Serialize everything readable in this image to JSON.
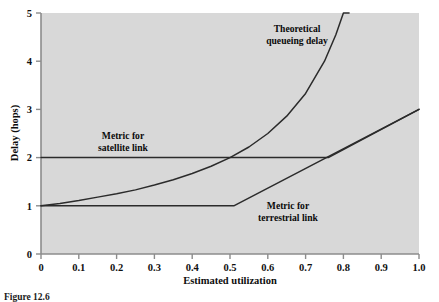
{
  "chart_data": {
    "type": "line",
    "title": "",
    "xlabel": "Estimated utilization",
    "ylabel": "Delay (hops)",
    "xlim": [
      0,
      1.0
    ],
    "ylim": [
      0,
      5
    ],
    "grid": false,
    "legend_position": "inline-annotations",
    "plot_background": "#d8d8d8",
    "line_color": "#2b2b2b",
    "axis_color": "#8c8c8c",
    "xticks": [
      0,
      0.1,
      0.2,
      0.3,
      0.4,
      0.5,
      0.6,
      0.7,
      0.8,
      0.9,
      1.0
    ],
    "xtick_labels": [
      "0",
      "0.1",
      "0.2",
      "0.3",
      "0.4",
      "0.5",
      "0.6",
      "0.7",
      "0.8",
      "0.9",
      "1.0"
    ],
    "yticks": [
      0,
      1,
      2,
      3,
      4,
      5
    ],
    "ytick_labels": [
      "0",
      "1",
      "2",
      "3",
      "4",
      "5"
    ],
    "series": [
      {
        "name": "Theoretical queueing delay",
        "annotation": "Theoretical\nqueueing delay",
        "annotation_line1": "Theoretical",
        "annotation_line2": "queueing delay",
        "x": [
          0.0,
          0.05,
          0.1,
          0.15,
          0.2,
          0.25,
          0.3,
          0.35,
          0.4,
          0.45,
          0.5,
          0.55,
          0.6,
          0.65,
          0.7,
          0.75,
          0.78,
          0.8,
          0.815
        ],
        "values": [
          1.0,
          1.05,
          1.11,
          1.18,
          1.25,
          1.33,
          1.43,
          1.54,
          1.67,
          1.82,
          2.0,
          2.22,
          2.5,
          2.86,
          3.33,
          4.0,
          4.55,
          5.0,
          5.0
        ]
      },
      {
        "name": "Metric for satellite link",
        "annotation_line1": "Metric for",
        "annotation_line2": "satellite link",
        "x": [
          0.0,
          0.76,
          1.0
        ],
        "values": [
          2.0,
          2.0,
          3.0
        ]
      },
      {
        "name": "Metric for terrestrial link",
        "annotation_line1": "Metric for",
        "annotation_line2": "terrestrial link",
        "x": [
          0.0,
          0.51,
          1.0
        ],
        "values": [
          1.0,
          1.0,
          3.0
        ]
      }
    ]
  },
  "annotations": {
    "theoretical": {
      "line1": "Theoretical",
      "line2": "queueing delay"
    },
    "satellite": {
      "line1": "Metric for",
      "line2": "satellite link"
    },
    "terrestrial": {
      "line1": "Metric for",
      "line2": "terrestrial link"
    }
  },
  "axis": {
    "x_title": "Estimated utilization",
    "y_title": "Delay (hops)"
  },
  "caption": {
    "text": "Figure 12.6"
  }
}
